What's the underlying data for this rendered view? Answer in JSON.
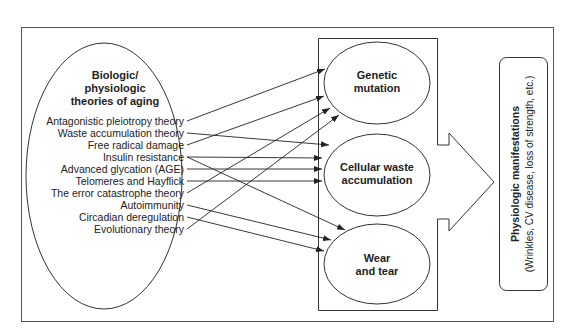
{
  "diagram": {
    "theories_title": [
      "Biologic/",
      "physiologic",
      "theories of aging"
    ],
    "theories": [
      "Antagonistic pleiotropy theory",
      "Waste accumulation theory",
      "Free radical damage",
      "Insulin resistance",
      "Advanced glycation (AGE)",
      "Telomeres and Hayflick",
      "The error catastrophe theory",
      "Autoimmunity",
      "Circadian deregulation",
      "Evolutionary theory"
    ],
    "mechanisms": [
      {
        "lines": [
          "Genetic",
          "mutation"
        ]
      },
      {
        "lines": [
          "Cellular waste",
          "accumulation"
        ]
      },
      {
        "lines": [
          "Wear",
          "and tear"
        ]
      }
    ],
    "outcome": {
      "title": "Physiologic manifestations",
      "subtitle": "(Wrinkles, CV disease, loss of strength, etc.)"
    },
    "connections": [
      {
        "from": "Antagonistic pleiotropy theory",
        "to": "Genetic mutation"
      },
      {
        "from": "Waste accumulation theory",
        "to": "Cellular waste accumulation"
      },
      {
        "from": "Free radical damage",
        "to": "Genetic mutation"
      },
      {
        "from": "Insulin resistance",
        "to": "Cellular waste accumulation"
      },
      {
        "from": "Insulin resistance",
        "to": "Wear and tear"
      },
      {
        "from": "Advanced glycation (AGE)",
        "to": "Cellular waste accumulation"
      },
      {
        "from": "Telomeres and Hayflick",
        "to": "Cellular waste accumulation"
      },
      {
        "from": "The error catastrophe theory",
        "to": "Genetic mutation"
      },
      {
        "from": "Autoimmunity",
        "to": "Wear and tear"
      },
      {
        "from": "Circadian deregulation",
        "to": "Wear and tear"
      },
      {
        "from": "Evolutionary theory",
        "to": "Genetic mutation"
      }
    ]
  }
}
